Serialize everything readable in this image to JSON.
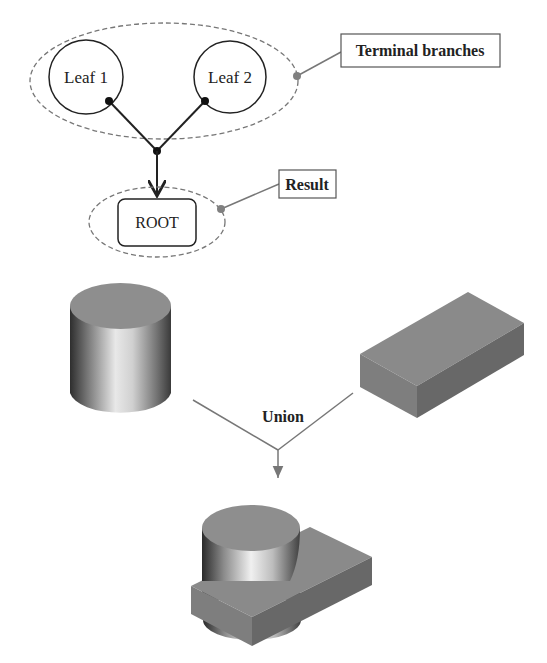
{
  "tree": {
    "leaves": [
      {
        "label": "Leaf 1"
      },
      {
        "label": "Leaf 2"
      }
    ],
    "root": {
      "label": "ROOT"
    },
    "callouts": {
      "terminal_branches": "Terminal branches",
      "result": "Result"
    }
  },
  "csg": {
    "operation_label": "Union",
    "inputs": [
      {
        "shape": "cylinder"
      },
      {
        "shape": "box"
      }
    ],
    "output": {
      "shape": "cylinder-box-union"
    }
  },
  "colors": {
    "line": "#222222",
    "dashed": "#777777",
    "callout_line": "#777777",
    "callout_dot": "#808080",
    "solid_face_top": "#8a8a8a",
    "solid_face_front": "#7c7c7c",
    "solid_face_side": "#6a6a6a"
  }
}
